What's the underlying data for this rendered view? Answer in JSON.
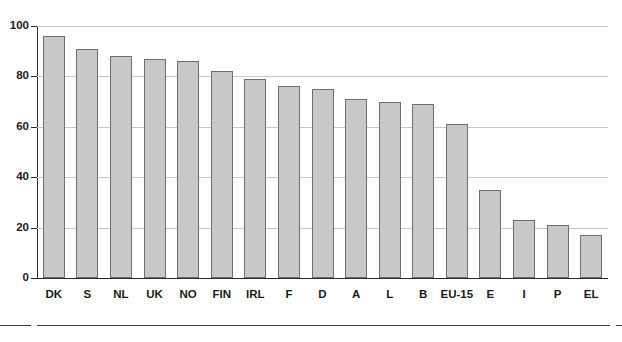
{
  "chart_data": {
    "type": "bar",
    "title": "",
    "subtitle": "",
    "xlabel": "",
    "ylabel": "",
    "ylim": [
      0,
      100
    ],
    "yticks": [
      0,
      20,
      40,
      60,
      80,
      100
    ],
    "grid": true,
    "legend": "none",
    "categories": [
      "DK",
      "S",
      "NL",
      "UK",
      "NO",
      "FIN",
      "IRL",
      "F",
      "D",
      "A",
      "L",
      "B",
      "EU-15",
      "E",
      "I",
      "P",
      "EL"
    ],
    "values": [
      96,
      91,
      88,
      87,
      86,
      82,
      79,
      76,
      75,
      71,
      70,
      69,
      61,
      35,
      23,
      21,
      17
    ],
    "series": [
      {
        "name": "",
        "values": [
          96,
          91,
          88,
          87,
          86,
          82,
          79,
          76,
          75,
          71,
          70,
          69,
          61,
          35,
          23,
          21,
          17
        ]
      }
    ],
    "bar_color": "#c8c8c8",
    "bar_border_color": "#6e6e6e",
    "gridline_color": "#c9c9c9",
    "axis_color": "#2b2b2b"
  }
}
